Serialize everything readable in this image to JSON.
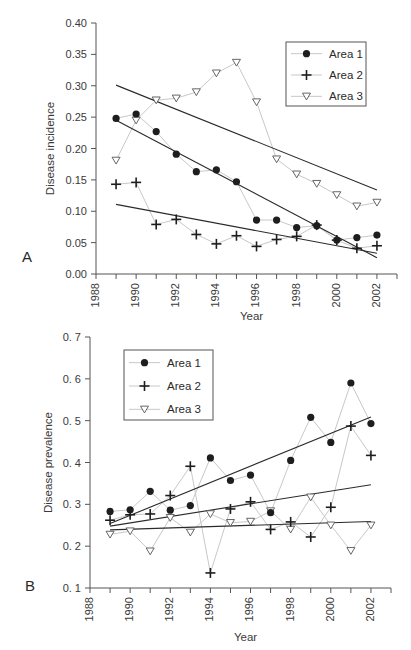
{
  "chart_data": [
    {
      "id": "A",
      "type": "line",
      "panel_label": "A",
      "title": "",
      "xlabel": "Year",
      "ylabel": "Disease incidence",
      "xlim": [
        1988,
        2003
      ],
      "ylim": [
        0.0,
        0.4
      ],
      "x_ticks": [
        1988,
        1990,
        1992,
        1994,
        1996,
        1998,
        2000,
        2002
      ],
      "x_minor_ticks": [
        1988,
        1989,
        1990,
        1991,
        1992,
        1993,
        1994,
        1995,
        1996,
        1997,
        1998,
        1999,
        2000,
        2001,
        2002,
        2003
      ],
      "y_ticks": [
        "0.00",
        "0.05",
        "0.10",
        "0.15",
        "0.20",
        "0.25",
        "0.30",
        "0.35",
        "0.40"
      ],
      "y_tick_values": [
        0.0,
        0.05,
        0.1,
        0.15,
        0.2,
        0.25,
        0.3,
        0.35,
        0.4
      ],
      "grid": false,
      "legend_position": "upper right",
      "x": [
        1989,
        1990,
        1991,
        1992,
        1993,
        1994,
        1995,
        1996,
        1997,
        1998,
        1999,
        2000,
        2001,
        2002
      ],
      "series": [
        {
          "name": "Area 1",
          "marker": "filled-circle",
          "values": [
            0.248,
            0.255,
            0.227,
            0.191,
            0.163,
            0.166,
            0.147,
            0.086,
            0.086,
            0.074,
            0.077,
            0.054,
            0.058,
            0.062
          ],
          "trend": [
            0.245,
            0.026
          ]
        },
        {
          "name": "Area 2",
          "marker": "plus",
          "values": [
            0.143,
            0.146,
            0.079,
            0.087,
            0.063,
            0.048,
            0.061,
            0.044,
            0.055,
            0.06,
            0.078,
            0.054,
            0.041,
            0.045
          ],
          "trend": [
            0.111,
            0.033
          ]
        },
        {
          "name": "Area 3",
          "marker": "open-triangle-down",
          "values": [
            0.181,
            0.245,
            0.277,
            0.28,
            0.29,
            0.32,
            0.337,
            0.274,
            0.183,
            0.159,
            0.144,
            0.126,
            0.108,
            0.114
          ],
          "trend": [
            0.301,
            0.134
          ]
        }
      ]
    },
    {
      "id": "B",
      "type": "line",
      "panel_label": "B",
      "title": "",
      "xlabel": "Year",
      "ylabel": "Disease prevalence",
      "xlim": [
        1988,
        2003
      ],
      "ylim": [
        0.1,
        0.7
      ],
      "x_ticks": [
        1988,
        1990,
        1992,
        1994,
        1996,
        1998,
        2000,
        2002
      ],
      "x_minor_ticks": [
        1988,
        1989,
        1990,
        1991,
        1992,
        1993,
        1994,
        1995,
        1996,
        1997,
        1998,
        1999,
        2000,
        2001,
        2002,
        2003
      ],
      "y_ticks": [
        "0. 1",
        "0. 2",
        "0. 3",
        "0. 4",
        "0. 5",
        "0. 6",
        "0. 7"
      ],
      "y_tick_values": [
        0.1,
        0.2,
        0.3,
        0.4,
        0.5,
        0.6,
        0.7
      ],
      "grid": false,
      "legend_position": "upper left",
      "x": [
        1989,
        1990,
        1991,
        1992,
        1993,
        1994,
        1995,
        1996,
        1997,
        1998,
        1999,
        2000,
        2001,
        2002
      ],
      "series": [
        {
          "name": "Area 1",
          "marker": "filled-circle",
          "values": [
            0.283,
            0.287,
            0.331,
            0.286,
            0.297,
            0.411,
            0.357,
            0.37,
            0.28,
            0.405,
            0.508,
            0.448,
            0.59,
            0.493
          ],
          "trend": [
            0.254,
            0.509
          ]
        },
        {
          "name": "Area 2",
          "marker": "plus",
          "values": [
            0.262,
            0.275,
            0.277,
            0.321,
            0.391,
            0.136,
            0.289,
            0.306,
            0.24,
            0.258,
            0.222,
            0.293,
            0.487,
            0.417
          ],
          "trend": [
            0.248,
            0.347
          ]
        },
        {
          "name": "Area 3",
          "marker": "open-triangle-down",
          "values": [
            0.228,
            0.236,
            0.188,
            0.268,
            0.233,
            0.277,
            0.256,
            0.259,
            0.284,
            0.24,
            0.317,
            0.25,
            0.189,
            0.25
          ],
          "trend": [
            0.239,
            0.259
          ]
        }
      ]
    }
  ],
  "colors": {
    "data_line": "#c8c8c8",
    "trend_line": "#2a2a2a",
    "marker": "#1e1e1e",
    "axis": "#555555",
    "legend_border": "#555555"
  }
}
